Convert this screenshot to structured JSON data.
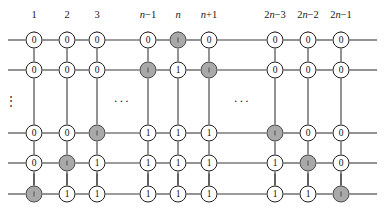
{
  "figure": {
    "type": "grid-graph-diagram",
    "width": 385,
    "height": 218,
    "background_color": "#ffffff",
    "line_color": "#3a3a3a",
    "node_fill_empty": "#ffffff",
    "node_fill_shaded": "#a9a9a9",
    "node_border_color": "#1f1f1f"
  },
  "column_labels": [
    {
      "id": "col-1",
      "text": "1",
      "italic_part": "",
      "x": 34
    },
    {
      "id": "col-2",
      "text": "2",
      "italic_part": "",
      "x": 67
    },
    {
      "id": "col-3",
      "text": "3",
      "italic_part": "",
      "x": 97
    },
    {
      "id": "col-nm1",
      "text": "n−1",
      "italic_part": "n",
      "x": 148
    },
    {
      "id": "col-n",
      "text": "n",
      "italic_part": "n",
      "x": 178
    },
    {
      "id": "col-np1",
      "text": "n+1",
      "italic_part": "n",
      "x": 209
    },
    {
      "id": "col-2nm3",
      "text": "2n−3",
      "italic_part": "n",
      "x": 275
    },
    {
      "id": "col-2nm2",
      "text": "2n−2",
      "italic_part": "n",
      "x": 308
    },
    {
      "id": "col-2nm1",
      "text": "2n−1",
      "italic_part": "n",
      "x": 341
    }
  ],
  "column_x": [
    34,
    67,
    97,
    148,
    178,
    209,
    275,
    308,
    341
  ],
  "row_y": [
    40,
    70,
    133,
    163,
    194
  ],
  "labels_y": 14,
  "rows": [
    {
      "row_index": 0,
      "nodes": [
        {
          "value": "0",
          "shaded": false
        },
        {
          "value": "0",
          "shaded": false
        },
        {
          "value": "0",
          "shaded": false
        },
        {
          "value": "0",
          "shaded": false
        },
        {
          "value": "0",
          "shaded": true
        },
        {
          "value": "0",
          "shaded": false
        },
        {
          "value": "0",
          "shaded": false
        },
        {
          "value": "0",
          "shaded": false
        },
        {
          "value": "0",
          "shaded": false
        }
      ]
    },
    {
      "row_index": 1,
      "nodes": [
        {
          "value": "0",
          "shaded": false
        },
        {
          "value": "0",
          "shaded": false
        },
        {
          "value": "0",
          "shaded": false
        },
        {
          "value": "0",
          "shaded": true
        },
        {
          "value": "1",
          "shaded": false
        },
        {
          "value": "0",
          "shaded": true
        },
        {
          "value": "0",
          "shaded": false
        },
        {
          "value": "0",
          "shaded": false
        },
        {
          "value": "0",
          "shaded": false
        }
      ]
    },
    {
      "row_index": 2,
      "nodes": [
        {
          "value": "0",
          "shaded": false
        },
        {
          "value": "0",
          "shaded": false
        },
        {
          "value": "0",
          "shaded": true
        },
        {
          "value": "1",
          "shaded": false
        },
        {
          "value": "1",
          "shaded": false
        },
        {
          "value": "1",
          "shaded": false
        },
        {
          "value": "0",
          "shaded": true
        },
        {
          "value": "0",
          "shaded": false
        },
        {
          "value": "0",
          "shaded": false
        }
      ]
    },
    {
      "row_index": 3,
      "nodes": [
        {
          "value": "0",
          "shaded": false
        },
        {
          "value": "0",
          "shaded": true
        },
        {
          "value": "1",
          "shaded": false
        },
        {
          "value": "1",
          "shaded": false
        },
        {
          "value": "1",
          "shaded": false
        },
        {
          "value": "1",
          "shaded": false
        },
        {
          "value": "1",
          "shaded": false
        },
        {
          "value": "1",
          "shaded": true
        },
        {
          "value": "0",
          "shaded": false
        }
      ]
    },
    {
      "row_index": 4,
      "nodes": [
        {
          "value": "1",
          "shaded": true
        },
        {
          "value": "1",
          "shaded": false
        },
        {
          "value": "1",
          "shaded": false
        },
        {
          "value": "1",
          "shaded": false
        },
        {
          "value": "1",
          "shaded": false
        },
        {
          "value": "1",
          "shaded": false
        },
        {
          "value": "1",
          "shaded": false
        },
        {
          "value": "1",
          "shaded": false
        },
        {
          "value": "1",
          "shaded": true
        }
      ]
    }
  ],
  "ellipses": {
    "vertical": {
      "text": "⋮",
      "x": 11,
      "y": 101
    },
    "horizontal": [
      {
        "id": "hdots-left",
        "text": "···",
        "x": 122,
        "y": 101
      },
      {
        "id": "hdots-right",
        "text": "···",
        "x": 242,
        "y": 101
      }
    ]
  }
}
